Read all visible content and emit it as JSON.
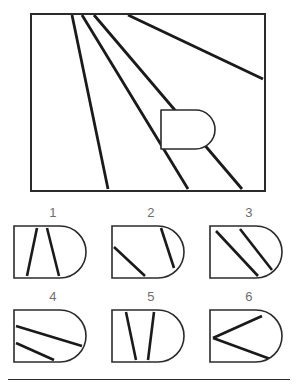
{
  "puzzle": {
    "type": "spatial-reasoning-figure-matching",
    "stimulus": {
      "name": "stimulus-figure",
      "frame": {
        "x": 1,
        "y": 1,
        "width": 234,
        "height": 177,
        "stroke": "#2b2b2b",
        "stroke_width": 2
      },
      "lines": [
        {
          "name": "ray-1",
          "x1": 42,
          "y1": 2,
          "x2": 78,
          "y2": 176
        },
        {
          "name": "ray-2",
          "x1": 52,
          "y1": 2,
          "x2": 158,
          "y2": 176
        },
        {
          "name": "ray-3",
          "x1": 64,
          "y1": 2,
          "x2": 212,
          "y2": 176
        },
        {
          "name": "ray-4",
          "x1": 98,
          "y1": 2,
          "x2": 233,
          "y2": 66
        }
      ],
      "dshape": {
        "name": "d-shape-overlay",
        "x": 131,
        "y": 97,
        "width": 54,
        "height": 39,
        "fill": "#ffffff",
        "stroke": "#2b2b2b",
        "stroke_width": 1.6
      }
    },
    "options": [
      {
        "number": "1",
        "name": "option-1",
        "lines": [
          {
            "x1": 23,
            "y1": 2,
            "x2": 13,
            "y2": 50
          },
          {
            "x1": 33,
            "y1": 2,
            "x2": 45,
            "y2": 50
          }
        ]
      },
      {
        "number": "2",
        "name": "option-2",
        "lines": [
          {
            "x1": 2,
            "y1": 21,
            "x2": 33,
            "y2": 50
          },
          {
            "x1": 49,
            "y1": 2,
            "x2": 62,
            "y2": 42
          }
        ]
      },
      {
        "number": "3",
        "name": "option-3",
        "lines": [
          {
            "x1": 6,
            "y1": 5,
            "x2": 48,
            "y2": 50
          },
          {
            "x1": 30,
            "y1": 3,
            "x2": 62,
            "y2": 44
          }
        ]
      },
      {
        "number": "4",
        "name": "option-4",
        "lines": [
          {
            "x1": 2,
            "y1": 16,
            "x2": 68,
            "y2": 36
          },
          {
            "x1": 2,
            "y1": 33,
            "x2": 40,
            "y2": 50
          }
        ]
      },
      {
        "number": "5",
        "name": "option-5",
        "lines": [
          {
            "x1": 14,
            "y1": 2,
            "x2": 24,
            "y2": 50
          },
          {
            "x1": 42,
            "y1": 2,
            "x2": 36,
            "y2": 50
          }
        ]
      },
      {
        "number": "6",
        "name": "option-6",
        "lines": [
          {
            "x1": 3,
            "y1": 28,
            "x2": 52,
            "y2": 6
          },
          {
            "x1": 3,
            "y1": 28,
            "x2": 63,
            "y2": 50
          }
        ]
      }
    ],
    "option_shape": {
      "name": "d-outline",
      "width": 72,
      "height": 52,
      "flat_width": 46,
      "stroke": "#2b2b2b",
      "stroke_width": 1.6,
      "line_stroke": "#1a1a1a",
      "line_stroke_width": 2.6
    },
    "colors": {
      "ink": "#2b2b2b",
      "line": "#1a1a1a",
      "number": "#6e6e6e",
      "paper": "#ffffff"
    }
  }
}
